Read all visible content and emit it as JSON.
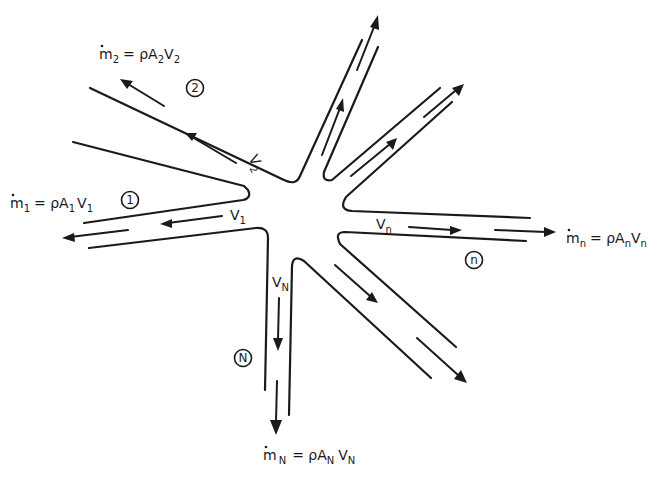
{
  "diagram": {
    "outlets": {
      "branch_1": {
        "circle_label": "1",
        "velocity_label": "V",
        "velocity_sub": "1",
        "eq_m": "m",
        "eq_m_sub": "1",
        "eq_rest": "= ρA",
        "eq_A_sub": "1",
        "eq_V": "V",
        "eq_V_sub": "1"
      },
      "branch_2": {
        "circle_label": "2",
        "velocity_label": "V",
        "velocity_sub": "2",
        "eq_m": "m",
        "eq_m_sub": "2",
        "eq_rest": "= ρA",
        "eq_A_sub": "2",
        "eq_V": "V",
        "eq_V_sub": "2"
      },
      "branch_n": {
        "circle_label": "n",
        "velocity_label": "V",
        "velocity_sub": "n",
        "eq_m": "m",
        "eq_m_sub": "n",
        "eq_rest": "= ρA",
        "eq_A_sub": "n",
        "eq_V": "V",
        "eq_V_sub": "n"
      },
      "branch_N": {
        "circle_label": "N",
        "velocity_label": "V",
        "velocity_sub": "N",
        "eq_m": "m",
        "eq_m_sub": "N",
        "eq_rest": "= ρA",
        "eq_A_sub": "N",
        "eq_V": "V",
        "eq_V_sub": "N"
      }
    },
    "unlabeled_branches": 3,
    "colors": {
      "ink": "#1a1a1a",
      "background": "#ffffff"
    }
  }
}
